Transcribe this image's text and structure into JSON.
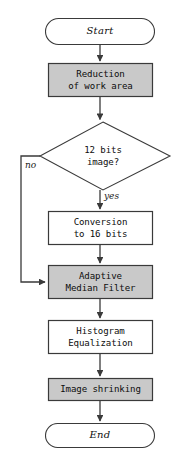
{
  "diagram": {
    "type": "flowchart",
    "colors": {
      "process_fill": "#c9c9c9",
      "plain_fill": "#ffffff",
      "stroke": "#3a3a3a",
      "text": "#0d0d0d",
      "background": "#ffffff"
    },
    "nodes": [
      {
        "id": "start",
        "shape": "terminator",
        "label": "Start",
        "fill": "plain"
      },
      {
        "id": "reduction",
        "shape": "process",
        "line1": "Reduction",
        "line2": "of work area",
        "fill": "process"
      },
      {
        "id": "decision",
        "shape": "decision",
        "line1": "12 bits",
        "line2": "image?",
        "fill": "plain"
      },
      {
        "id": "conversion",
        "shape": "process",
        "line1": "Conversion",
        "line2": "to 16 bits",
        "fill": "plain"
      },
      {
        "id": "median",
        "shape": "process",
        "line1": "Adaptive",
        "line2": "Median Filter",
        "fill": "process"
      },
      {
        "id": "histogram",
        "shape": "process",
        "line1": "Histogram",
        "line2": "Equalization",
        "fill": "plain"
      },
      {
        "id": "shrink",
        "shape": "process",
        "line1": "Image shrinking",
        "line2": "",
        "fill": "process"
      },
      {
        "id": "end",
        "shape": "terminator",
        "label": "End",
        "fill": "plain"
      }
    ],
    "edges": [
      {
        "from": "start",
        "to": "reduction",
        "label": ""
      },
      {
        "from": "reduction",
        "to": "decision",
        "label": ""
      },
      {
        "from": "decision",
        "to": "conversion",
        "label": "yes"
      },
      {
        "from": "decision",
        "to": "median",
        "label": "no"
      },
      {
        "from": "conversion",
        "to": "median",
        "label": ""
      },
      {
        "from": "median",
        "to": "histogram",
        "label": ""
      },
      {
        "from": "histogram",
        "to": "shrink",
        "label": ""
      },
      {
        "from": "shrink",
        "to": "end",
        "label": ""
      }
    ],
    "edge_labels": {
      "no": "no",
      "yes": "yes"
    }
  }
}
